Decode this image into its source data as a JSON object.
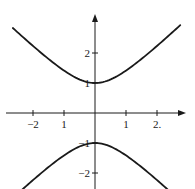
{
  "chart_data": {
    "type": "line",
    "title": "",
    "xlabel": "",
    "ylabel": "",
    "equation_hint": "y^2 - x^2 = 1 (hyperbola, two branches)",
    "xlim": [
      -3.0,
      2.9
    ],
    "ylim": [
      -2.5,
      3.2
    ],
    "grid": false,
    "legend": null,
    "x_ticks": [
      {
        "value": -2,
        "label": "−2"
      },
      {
        "value": -1,
        "label": "1"
      },
      {
        "value": 1,
        "label": "1"
      },
      {
        "value": 2,
        "label": "2."
      }
    ],
    "y_ticks": [
      {
        "value": 2,
        "label": "2"
      },
      {
        "value": 1,
        "label": "1"
      },
      {
        "value": -1,
        "label": "−1"
      },
      {
        "value": -2,
        "label": "−2"
      }
    ],
    "series": [
      {
        "name": "upper branch",
        "x": [
          -2.65,
          -2.0,
          -1.5,
          -1.0,
          -0.5,
          0.0,
          0.5,
          1.0,
          1.5,
          2.0,
          2.75
        ],
        "y": [
          2.83,
          2.24,
          1.8,
          1.41,
          1.12,
          1.0,
          1.12,
          1.41,
          1.8,
          2.24,
          2.93
        ]
      },
      {
        "name": "lower branch",
        "x": [
          -2.4,
          -2.0,
          -1.5,
          -1.0,
          -0.5,
          0.0,
          0.5,
          1.0,
          1.5,
          2.0,
          2.35
        ],
        "y": [
          -2.6,
          -2.24,
          -1.8,
          -1.41,
          -1.12,
          -1.0,
          -1.12,
          -1.41,
          -1.8,
          -2.24,
          -2.55
        ]
      }
    ],
    "pixel_mapping": {
      "origin_px": [
        95,
        113
      ],
      "px_per_unit_x": 31,
      "px_per_unit_y": 30
    }
  }
}
